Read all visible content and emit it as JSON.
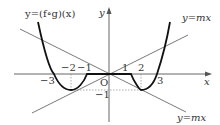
{
  "diagram": {
    "type": "function-graph",
    "curve_label": "y=(f∘g)(x)",
    "line_label_upper": "y=mx",
    "line_label_lower": "y=mx",
    "axis_x_label": "x",
    "axis_y_label": "y",
    "origin_label": "O",
    "x_ticks": [
      {
        "value": -3,
        "label": "−3"
      },
      {
        "value": -2,
        "label": "−2"
      },
      {
        "value": -1,
        "label": "−1"
      },
      {
        "value": 1,
        "label": "1"
      },
      {
        "value": 2,
        "label": "2"
      },
      {
        "value": 3,
        "label": "3"
      }
    ],
    "y_ticks": [
      {
        "value": -1,
        "label": "−1"
      }
    ],
    "key_points": [
      {
        "x": -3,
        "y": 0,
        "note": "x-intercept"
      },
      {
        "x": -2,
        "y": -1,
        "note": "local minimum"
      },
      {
        "x": -1,
        "y": 0,
        "note": "start of flat segment"
      },
      {
        "x": 1,
        "y": 0,
        "note": "end of flat segment"
      },
      {
        "x": 2,
        "y": -1,
        "note": "local minimum"
      },
      {
        "x": 3,
        "y": 0,
        "note": "x-intercept"
      }
    ],
    "lines": [
      {
        "label": "y=mx",
        "slope": 0.5,
        "passes_through": [
          [
            0,
            0
          ],
          [
            -2,
            -1
          ]
        ]
      },
      {
        "label": "y=mx",
        "slope": -0.5,
        "passes_through": [
          [
            0,
            0
          ],
          [
            2,
            -1
          ]
        ]
      }
    ],
    "colors": {
      "curve": "#111111",
      "lines": "#555555",
      "axes": "#555555",
      "dashed": "#777777",
      "text": "#333333"
    }
  }
}
